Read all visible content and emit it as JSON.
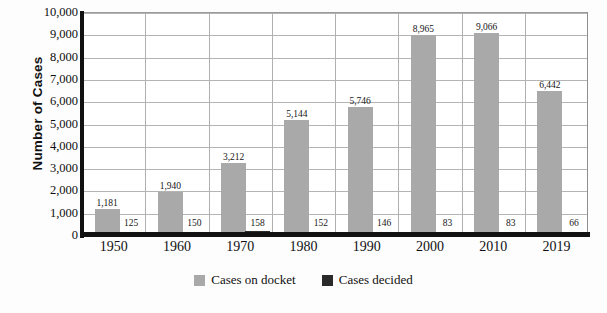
{
  "chart_data": {
    "type": "bar",
    "title": "",
    "xlabel": "",
    "ylabel": "Number of Cases",
    "categories": [
      "1950",
      "1960",
      "1970",
      "1980",
      "1990",
      "2000",
      "2010",
      "2019"
    ],
    "series": [
      {
        "name": "Cases on docket",
        "color": "#a9a9a9",
        "values": [
          1181,
          1940,
          3212,
          5144,
          5746,
          8965,
          9066,
          6442
        ],
        "labels": [
          "1,181",
          "1,940",
          "3,212",
          "5,144",
          "5,746",
          "8,965",
          "9,066",
          "6,442"
        ]
      },
      {
        "name": "Cases decided",
        "color": "#2a2a2a",
        "values": [
          125,
          150,
          158,
          152,
          146,
          83,
          83,
          66
        ],
        "labels": [
          "125",
          "150",
          "158",
          "152",
          "146",
          "83",
          "83",
          "66"
        ]
      }
    ],
    "ylim": [
      0,
      10000
    ],
    "ytick_values": [
      0,
      1000,
      2000,
      3000,
      4000,
      5000,
      6000,
      7000,
      8000,
      9000,
      10000
    ],
    "ytick_labels": [
      "0",
      "1,000",
      "2,000",
      "3,000",
      "4,000",
      "5,000",
      "6,000",
      "7,000",
      "8,000",
      "9,000",
      "10,000"
    ],
    "grid": "horizontal-and-vertical",
    "legend_position": "bottom-center"
  },
  "legend": {
    "items": [
      {
        "label": "Cases on docket",
        "color": "#a9a9a9"
      },
      {
        "label": "Cases decided",
        "color": "#2a2a2a"
      }
    ]
  }
}
